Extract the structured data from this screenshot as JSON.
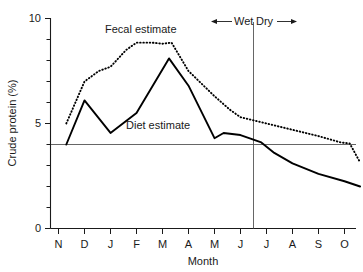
{
  "chart_data": {
    "type": "line",
    "title": "",
    "xlabel": "Month",
    "ylabel": "Crude protein (%)",
    "xlim": [
      0,
      12
    ],
    "ylim": [
      0,
      10
    ],
    "grid": false,
    "legend_position": "inline-annotations",
    "categories": [
      "N",
      "D",
      "J",
      "F",
      "M",
      "A",
      "M",
      "J",
      "J",
      "A",
      "S",
      "O"
    ],
    "x_tick_labels": [
      "N",
      "D",
      "J",
      "F",
      "M",
      "A",
      "M",
      "J",
      "J",
      "A",
      "S",
      "O"
    ],
    "y_tick_labels": [
      "0",
      "5",
      "10"
    ],
    "y_major_ticks": [
      0,
      5,
      10
    ],
    "y_minor_ticks": [
      1,
      2,
      3,
      4,
      6,
      7,
      8,
      9
    ],
    "series": [
      {
        "name": "Fecal estimate",
        "style": "dotted",
        "points": [
          {
            "x": 0.3,
            "y": 5.0
          },
          {
            "x": 1.0,
            "y": 7.0
          },
          {
            "x": 1.55,
            "y": 7.5
          },
          {
            "x": 2.0,
            "y": 7.7
          },
          {
            "x": 2.6,
            "y": 8.5
          },
          {
            "x": 3.0,
            "y": 8.85
          },
          {
            "x": 3.6,
            "y": 8.85
          },
          {
            "x": 4.0,
            "y": 8.8
          },
          {
            "x": 4.35,
            "y": 8.85
          },
          {
            "x": 5.0,
            "y": 7.5
          },
          {
            "x": 6.0,
            "y": 6.3
          },
          {
            "x": 6.6,
            "y": 5.65
          },
          {
            "x": 7.0,
            "y": 5.3
          },
          {
            "x": 8.0,
            "y": 5.0
          },
          {
            "x": 9.0,
            "y": 4.7
          },
          {
            "x": 10.0,
            "y": 4.4
          },
          {
            "x": 10.85,
            "y": 4.1
          },
          {
            "x": 11.2,
            "y": 4.05
          },
          {
            "x": 11.6,
            "y": 3.15
          }
        ]
      },
      {
        "name": "Diet estimate",
        "style": "solid",
        "points": [
          {
            "x": 0.3,
            "y": 4.0
          },
          {
            "x": 1.0,
            "y": 6.1
          },
          {
            "x": 2.0,
            "y": 4.55
          },
          {
            "x": 3.0,
            "y": 5.5
          },
          {
            "x": 4.25,
            "y": 8.1
          },
          {
            "x": 5.0,
            "y": 6.8
          },
          {
            "x": 6.0,
            "y": 4.3
          },
          {
            "x": 6.35,
            "y": 4.55
          },
          {
            "x": 7.0,
            "y": 4.45
          },
          {
            "x": 7.8,
            "y": 4.1
          },
          {
            "x": 8.3,
            "y": 3.6
          },
          {
            "x": 9.0,
            "y": 3.1
          },
          {
            "x": 10.0,
            "y": 2.6
          },
          {
            "x": 11.0,
            "y": 2.25
          },
          {
            "x": 11.6,
            "y": 2.0
          }
        ]
      }
    ],
    "reference_lines": [
      {
        "orientation": "horizontal",
        "value": 4.0,
        "label": ""
      },
      {
        "orientation": "vertical",
        "value": 7.5,
        "label": ""
      }
    ],
    "annotations": [
      {
        "name": "fecal-estimate-label",
        "text": "Fecal estimate",
        "x": 2.5,
        "y": 9.6
      },
      {
        "name": "diet-estimate-label",
        "text": "Diet estimate",
        "x": 3.1,
        "y": 4.75
      },
      {
        "name": "wet-season-label",
        "text": "Wet",
        "x": 7.0,
        "y": 10.35
      },
      {
        "name": "dry-season-label",
        "text": "Dry",
        "x": 8.0,
        "y": 10.35
      }
    ]
  },
  "axes": {
    "y_label": "Crude protein (%)",
    "x_label": "Month",
    "y_ticks": [
      "10",
      "5",
      "0"
    ],
    "x_ticks": [
      "N",
      "D",
      "J",
      "F",
      "M",
      "A",
      "M",
      "J",
      "J",
      "A",
      "S",
      "O"
    ]
  },
  "labels": {
    "fecal_estimate": "Fecal estimate",
    "diet_estimate": "Diet estimate",
    "wet": "Wet",
    "dry": "Dry"
  },
  "colors": {
    "ink": "#000000",
    "axis": "#1a1a1a",
    "reference": "#555555",
    "background": "#ffffff"
  }
}
